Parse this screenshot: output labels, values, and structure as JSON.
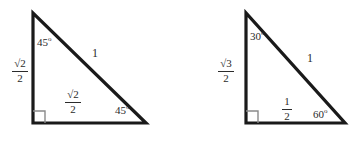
{
  "figure": {
    "background_color": "#ffffff",
    "stroke_color": "#1a1a1a",
    "right_angle_color": "#8a8a8a",
    "text_color": "#2b2b2b",
    "triangles": [
      {
        "name": "45-45-90-triangle",
        "vertices": {
          "apex": [
            33,
            13
          ],
          "bottom_left": [
            33,
            123
          ],
          "bottom_right": [
            146,
            123
          ]
        },
        "labels": {
          "apex_angle": "45",
          "apex_angle_degree_symbol": "o",
          "base_angle": "45",
          "base_angle_degree_symbol": "o",
          "hypotenuse": "1",
          "vertical_leg_numerator": "√2",
          "vertical_leg_denominator": "2",
          "horizontal_leg_numerator": "√2",
          "horizontal_leg_denominator": "2"
        }
      },
      {
        "name": "30-60-90-triangle",
        "vertices": {
          "apex": [
            246,
            13
          ],
          "bottom_left": [
            246,
            123
          ],
          "bottom_right": [
            345,
            123
          ]
        },
        "labels": {
          "apex_angle": "30",
          "apex_angle_degree_symbol": "o",
          "base_angle": "60",
          "base_angle_degree_symbol": "o",
          "hypotenuse": "1",
          "vertical_leg_numerator": "√3",
          "vertical_leg_denominator": "2",
          "horizontal_leg_numerator": "1",
          "horizontal_leg_denominator": "2"
        }
      }
    ]
  }
}
